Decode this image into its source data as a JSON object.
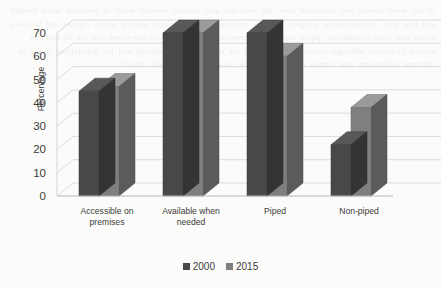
{
  "chart_data": {
    "type": "bar",
    "title": "",
    "subtitle": "",
    "xlabel": "",
    "ylabel": "Percentage",
    "categories": [
      "Accessible on premises",
      "Available when needed",
      "Piped",
      "Non-piped"
    ],
    "category_lines": [
      [
        "Accessible on",
        "premises"
      ],
      [
        "Available when",
        "needed"
      ],
      [
        "Piped"
      ],
      [
        "Non-piped"
      ]
    ],
    "series": [
      {
        "name": "2000",
        "color": "#484848",
        "values": [
          45,
          70,
          70,
          22
        ]
      },
      {
        "name": "2015",
        "color": "#7f7f7f",
        "values": [
          47,
          70,
          60,
          38
        ]
      }
    ],
    "ylim": [
      0,
      70
    ],
    "ytick_step": 10,
    "yticks": [
      0,
      10,
      20,
      30,
      40,
      50,
      60,
      70
    ],
    "grid": true,
    "legend_position": "bottom",
    "style": "3d-clustered-column",
    "units": "percent"
  },
  "page": {
    "bleed_text": "of the water source and collection time. the indicator also reflects whether water is available when needed and free from contamination. progress towards universal access remains uneven across regions and between urban and rural populations. piped supplies on premises increased while non-piped sources declined in several countries, although coverage gaps persist for the poorest households and for populations living in informal settlements and remote rural areas where service levels remain limited.",
    "background_color": "#fbfbfa"
  }
}
